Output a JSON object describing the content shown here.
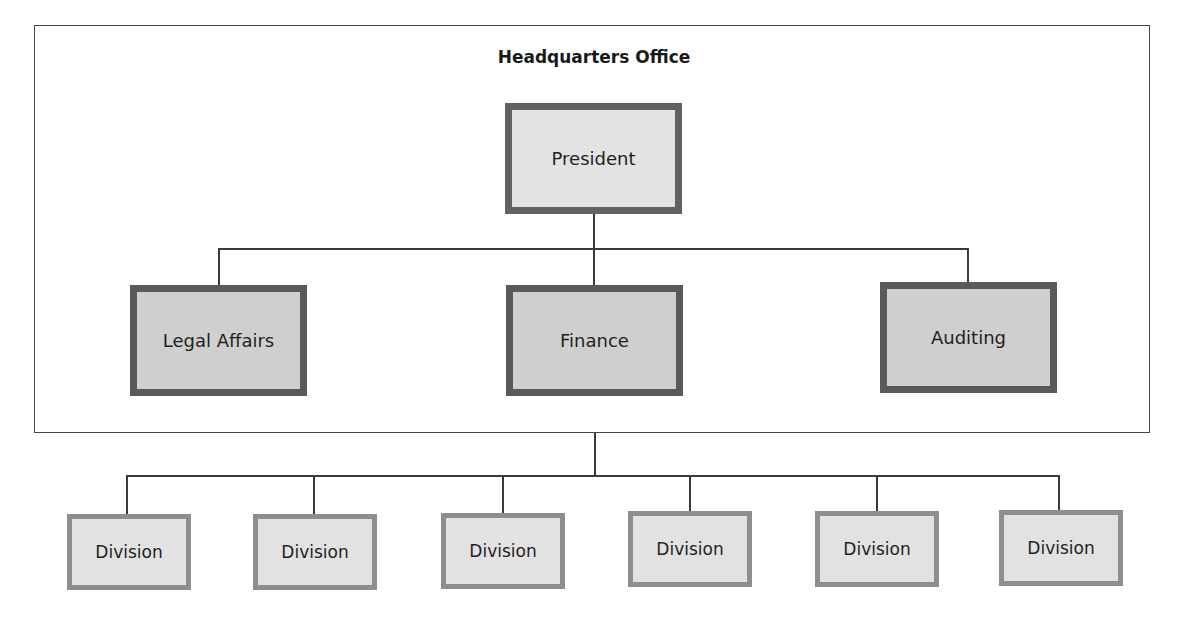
{
  "diagram": {
    "type": "organizational-chart",
    "container": {
      "title": "Headquarters Office"
    },
    "top": {
      "label": "President"
    },
    "departments": [
      {
        "label": "Legal Affairs"
      },
      {
        "label": "Finance"
      },
      {
        "label": "Auditing"
      }
    ],
    "divisions": [
      {
        "label": "Division"
      },
      {
        "label": "Division"
      },
      {
        "label": "Division"
      },
      {
        "label": "Division"
      },
      {
        "label": "Division"
      },
      {
        "label": "Division"
      }
    ],
    "colors": {
      "president_fill": "#e3e3e3",
      "president_border": "#626262",
      "department_fill": "#cfcfcf",
      "department_border": "#5a5a5a",
      "division_fill": "#e2e2e2",
      "division_border": "#8e8e8e",
      "line": "#3a3a3a"
    }
  }
}
